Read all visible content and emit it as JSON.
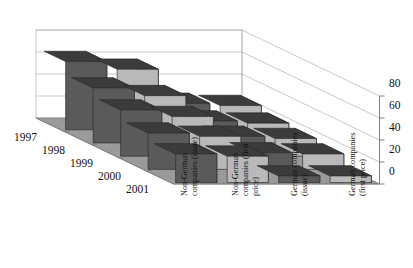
{
  "chart_data": {
    "type": "bar",
    "title": "",
    "subtitle": "",
    "xlabel": "",
    "ylabel": "",
    "zlabel": "",
    "projection": "3d",
    "grid": true,
    "legend": "none",
    "ylim": [
      0,
      80
    ],
    "yticks": [
      0,
      20,
      40,
      60,
      80
    ],
    "ytick_labels": [
      "0",
      "20",
      "40",
      "60",
      "80"
    ],
    "categories": [
      "Non-German companies (issue)",
      "Non-German companies (first price)",
      "German companies (issue)",
      "German companies (first price)"
    ],
    "category_lines": [
      [
        "Non-German",
        "companies (issue)"
      ],
      [
        "Non-German",
        "companies (first",
        "price)"
      ],
      [
        "German companies",
        "(issue)"
      ],
      [
        "German companies",
        "(first price)"
      ]
    ],
    "rows": [
      "1997",
      "1998",
      "1999",
      "2000",
      "2001"
    ],
    "series": [
      {
        "name": "1997",
        "values": [
          62,
          55,
          24,
          22
        ]
      },
      {
        "name": "1998",
        "values": [
          50,
          43,
          20,
          18
        ]
      },
      {
        "name": "1999",
        "values": [
          42,
          36,
          18,
          16
        ]
      },
      {
        "name": "2000",
        "values": [
          33,
          30,
          15,
          14
        ]
      },
      {
        "name": "2001",
        "values": [
          26,
          24,
          6,
          6
        ]
      }
    ],
    "colors": {
      "bar_front_dark": "#5a5a5a",
      "bar_front_light": "#b9b9b9",
      "bar_top": "#3b3b3b",
      "bar_side": "#4a4a4a",
      "floor": "#9a9a9a",
      "floor_edge": "#7d7d7d",
      "gridline": "#b0b0b0",
      "axis": "#808080",
      "background": "#ffffff",
      "text": "#111111"
    }
  },
  "axis": {
    "y_ticks": [
      {
        "value": "80"
      },
      {
        "value": "60"
      },
      {
        "value": "40"
      },
      {
        "value": "20"
      },
      {
        "value": "0"
      }
    ]
  },
  "rows": [
    {
      "label": "1997"
    },
    {
      "label": "1998"
    },
    {
      "label": "1999"
    },
    {
      "label": "2000"
    },
    {
      "label": "2001"
    }
  ],
  "categories": [
    {
      "l1": "Non-German",
      "l2": "companies (issue)",
      "l3": ""
    },
    {
      "l1": "Non-German",
      "l2": "companies (first",
      "l3": "price)"
    },
    {
      "l1": "German companies",
      "l2": "(issue)",
      "l3": ""
    },
    {
      "l1": "German companies",
      "l2": "(first price)",
      "l3": ""
    }
  ]
}
